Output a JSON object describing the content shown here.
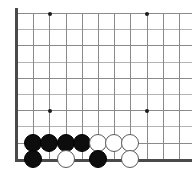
{
  "board": {
    "kind": "go-board",
    "description": "Go (Weiqi) board position, bottom-left corner region shown",
    "grid": {
      "origin_x": 17,
      "origin_y": 13,
      "cell": 16.2,
      "cols_visible": 11,
      "rows_visible": 10,
      "line_color": "#8a8a8a",
      "alt_line_color": "#b3b3b3",
      "border_color": "#4a4a4a",
      "background_color": "#ffffff"
    },
    "edges": {
      "left_border": true,
      "bottom_border": true,
      "top_border": false,
      "right_border": false
    },
    "star_points": [
      {
        "col": 2,
        "row": 0,
        "label": "upper-left-star"
      },
      {
        "col": 8,
        "row": 0,
        "label": "upper-right-star"
      },
      {
        "col": 2,
        "row": 6,
        "label": "lower-left-star"
      },
      {
        "col": 8,
        "row": 6,
        "label": "lower-right-star"
      }
    ],
    "stone_radius": 9,
    "stones": [
      {
        "col": 1,
        "row": 8,
        "color": "black",
        "id": "b1"
      },
      {
        "col": 2,
        "row": 8,
        "color": "black",
        "id": "b2"
      },
      {
        "col": 3,
        "row": 8,
        "color": "black",
        "id": "b3"
      },
      {
        "col": 4,
        "row": 8,
        "color": "black",
        "id": "b4"
      },
      {
        "col": 5,
        "row": 8,
        "color": "white",
        "id": "w1"
      },
      {
        "col": 6,
        "row": 8,
        "color": "white",
        "id": "w2"
      },
      {
        "col": 7,
        "row": 8,
        "color": "white",
        "id": "w3"
      },
      {
        "col": 1,
        "row": 9,
        "color": "black",
        "id": "b5"
      },
      {
        "col": 3,
        "row": 9,
        "color": "white",
        "id": "w4"
      },
      {
        "col": 5,
        "row": 9,
        "color": "black",
        "id": "b6"
      },
      {
        "col": 7,
        "row": 9,
        "color": "white",
        "id": "w5"
      }
    ],
    "counts": {
      "black_stones": 6,
      "white_stones": 5,
      "total_stones": 11
    }
  }
}
